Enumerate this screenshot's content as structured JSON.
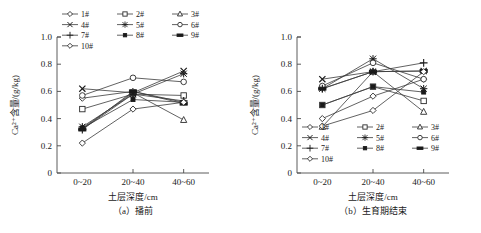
{
  "figure": {
    "panels": [
      {
        "id": "a",
        "caption": "（a）播前",
        "xlabel": "土层深度/cm",
        "ylabel": "Ca²⁺含量/(g/kg)",
        "legend_position": "above-plot"
      },
      {
        "id": "b",
        "caption": "（b）生育期结束",
        "xlabel": "土层深度/cm",
        "ylabel": "Ca²⁺含量/(g/kg)",
        "legend_position": "inside-lower-left"
      }
    ],
    "yticks": [
      "0",
      "0.2",
      "0.4",
      "0.6",
      "0.8",
      "1.0"
    ],
    "xticks": [
      "0~20",
      "20~40",
      "40~60"
    ],
    "legend_labels": [
      "1#",
      "2#",
      "3#",
      "4#",
      "5#",
      "6#",
      "7#",
      "8#",
      "9#",
      "10#"
    ],
    "markers": [
      "diamond",
      "square",
      "triangle",
      "xcross",
      "asterisk",
      "circle",
      "plus",
      "small-filled-square",
      "filled-bar",
      "diamond"
    ],
    "line_color": "#3a3a3a",
    "axis_color": "#4a4a4a"
  },
  "chart_data": [
    {
      "type": "line",
      "title": "（a）播前",
      "xlabel": "土层深度/cm",
      "ylabel": "Ca²⁺含量/(g/kg)",
      "categories": [
        "0~20",
        "20~40",
        "40~60"
      ],
      "ylim": [
        0,
        1.0
      ],
      "yticks": [
        0,
        0.2,
        0.4,
        0.6,
        0.8,
        1.0
      ],
      "grid": false,
      "legend": [
        "1#",
        "2#",
        "3#",
        "4#",
        "5#",
        "6#",
        "7#",
        "8#",
        "9#",
        "10#"
      ],
      "series": [
        {
          "name": "1#",
          "marker": "diamond",
          "values": [
            0.55,
            0.6,
            0.52
          ]
        },
        {
          "name": "2#",
          "marker": "square",
          "values": [
            0.47,
            0.58,
            0.57
          ]
        },
        {
          "name": "3#",
          "marker": "triangle",
          "values": [
            0.33,
            0.59,
            0.39
          ]
        },
        {
          "name": "4#",
          "marker": "xcross",
          "values": [
            0.62,
            0.59,
            0.75
          ]
        },
        {
          "name": "5#",
          "marker": "asterisk",
          "values": [
            0.34,
            0.58,
            0.73
          ]
        },
        {
          "name": "6#",
          "marker": "circle",
          "values": [
            0.57,
            0.7,
            0.67
          ]
        },
        {
          "name": "7#",
          "marker": "plus",
          "values": [
            0.32,
            0.58,
            0.53
          ]
        },
        {
          "name": "8#",
          "marker": "small-filled-square",
          "values": [
            0.33,
            0.54,
            0.52
          ]
        },
        {
          "name": "9#",
          "marker": "filled-bar",
          "values": [
            0.32,
            0.6,
            0.51
          ]
        },
        {
          "name": "10#",
          "marker": "diamond",
          "values": [
            0.22,
            0.47,
            0.52
          ]
        }
      ]
    },
    {
      "type": "line",
      "title": "（b）生育期结束",
      "xlabel": "土层深度/cm",
      "ylabel": "Ca²⁺含量/(g/kg)",
      "categories": [
        "0~20",
        "20~40",
        "40~60"
      ],
      "ylim": [
        0,
        1.0
      ],
      "yticks": [
        0,
        0.2,
        0.4,
        0.6,
        0.8,
        1.0
      ],
      "grid": false,
      "legend": [
        "1#",
        "2#",
        "3#",
        "4#",
        "5#",
        "6#",
        "7#",
        "8#",
        "9#",
        "10#"
      ],
      "series": [
        {
          "name": "1#",
          "marker": "diamond",
          "values": [
            0.4,
            0.565,
            0.69
          ]
        },
        {
          "name": "2#",
          "marker": "square",
          "values": [
            0.5,
            0.635,
            0.53
          ]
        },
        {
          "name": "3#",
          "marker": "triangle",
          "values": [
            0.34,
            0.745,
            0.45
          ]
        },
        {
          "name": "4#",
          "marker": "xcross",
          "values": [
            0.69,
            0.745,
            0.75
          ]
        },
        {
          "name": "5#",
          "marker": "asterisk",
          "values": [
            0.62,
            0.84,
            0.62
          ]
        },
        {
          "name": "6#",
          "marker": "circle",
          "values": [
            0.64,
            0.81,
            0.69
          ]
        },
        {
          "name": "7#",
          "marker": "plus",
          "values": [
            0.62,
            0.745,
            0.81
          ]
        },
        {
          "name": "8#",
          "marker": "small-filled-square",
          "values": [
            0.5,
            0.635,
            0.595
          ]
        },
        {
          "name": "9#",
          "marker": "filled-bar",
          "values": [
            0.62,
            0.745,
            0.75
          ]
        },
        {
          "name": "10#",
          "marker": "diamond",
          "values": [
            0.345,
            0.46,
            0.745
          ]
        }
      ]
    }
  ]
}
